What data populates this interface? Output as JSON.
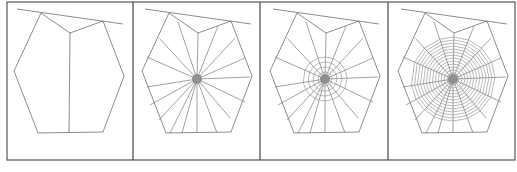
{
  "figure": {
    "panel_count": 4,
    "colors": {
      "background": "#ffffff",
      "border": "#555555",
      "line": "#6e6e6e",
      "hub": "#8f8f8f"
    },
    "outer_box": {
      "x": 7,
      "y": 2,
      "width": 508,
      "height": 158
    },
    "dividers_x": [
      133,
      260,
      388
    ],
    "panel_offsets_x": [
      0,
      128,
      256,
      384
    ],
    "frame": {
      "anchor_line": [
        [
          17,
          9
        ],
        [
          123,
          24
        ]
      ],
      "polygon": [
        [
          41,
          13
        ],
        [
          70,
          33
        ],
        [
          103,
          21
        ],
        [
          124,
          76
        ],
        [
          103,
          132
        ],
        [
          38,
          133
        ],
        [
          14,
          71
        ]
      ],
      "hub": [
        69,
        79
      ]
    },
    "panels": [
      {
        "name": "stage-1-frame",
        "description": "Frame threads with a single vertical radius",
        "show_radii": false,
        "spiral_rings": [],
        "hub_radius": 0
      },
      {
        "name": "stage-2-radii",
        "description": "Radial threads added to the hub",
        "show_radii": true,
        "spiral_rings": [],
        "hub_radius": 5
      },
      {
        "name": "stage-3-auxiliary-spiral",
        "description": "Temporary auxiliary spiral around the hub",
        "show_radii": true,
        "spiral_rings": [
          7,
          12,
          17,
          22
        ],
        "hub_radius": 5
      },
      {
        "name": "stage-4-capture-spiral",
        "description": "Capture spiral filling the web",
        "show_radii": true,
        "spiral_rings": [
          6,
          9,
          12,
          15,
          18,
          21,
          24,
          27,
          30,
          33,
          36,
          39,
          42
        ],
        "hub_radius": 5
      }
    ],
    "radius_endpoints": [
      [
        70,
        33
      ],
      [
        50,
        22
      ],
      [
        31,
        38
      ],
      [
        19,
        57
      ],
      [
        19,
        87
      ],
      [
        22,
        105
      ],
      [
        31,
        120
      ],
      [
        42,
        133
      ],
      [
        54,
        133
      ],
      [
        69,
        133
      ],
      [
        89,
        133
      ],
      [
        102,
        118
      ],
      [
        117,
        102
      ],
      [
        122,
        77
      ],
      [
        117,
        58
      ],
      [
        107,
        38
      ],
      [
        90,
        26
      ]
    ]
  }
}
